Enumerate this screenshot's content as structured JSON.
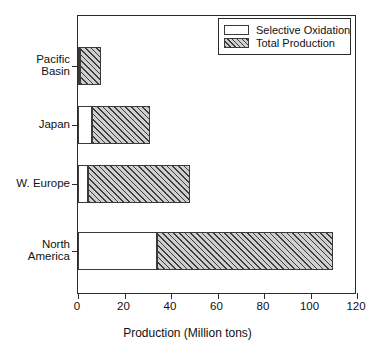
{
  "chart_data": {
    "type": "bar",
    "orientation": "horizontal",
    "stacked": true,
    "title": "",
    "xlabel": "Production (Million tons)",
    "ylabel": "",
    "xlim": [
      0,
      120
    ],
    "xticks": [
      0,
      20,
      40,
      60,
      80,
      100,
      120
    ],
    "xtick_labels": [
      "0",
      "20",
      "40",
      "60",
      "80",
      "100",
      "120"
    ],
    "grid": false,
    "legend_position": "top-right",
    "categories": [
      "Pacific Basin",
      "Japan",
      "W. Europe",
      "North America"
    ],
    "category_labels_wrapped": [
      "Pacific\nBasin",
      "Japan",
      "W. Europe",
      "North\nAmerica"
    ],
    "series": [
      {
        "name": "Selective Oxidation",
        "fill": "white",
        "values": [
          1,
          6,
          4.3,
          34
        ]
      },
      {
        "name": "Total Production",
        "fill": "hatched",
        "values": [
          10,
          31,
          48,
          109.5
        ]
      }
    ]
  },
  "legend": {
    "items": [
      {
        "label": "Selective Oxidation",
        "swatch": "white-box-icon"
      },
      {
        "label": "Total Production",
        "swatch": "hatched-box-icon"
      }
    ]
  },
  "axis": {
    "x_title": "Production (Million tons)",
    "x_tick_labels": [
      "0",
      "20",
      "40",
      "60",
      "80",
      "100",
      "120"
    ],
    "y_tick_labels": [
      "Pacific\nBasin",
      "Japan",
      "W. Europe",
      "North\nAmerica"
    ]
  },
  "colors": {
    "frame": "#2b2b2b",
    "bar_outline": "#3a3a3a",
    "hatch": "#3d3d3d",
    "hatch_bg": "#cfcfcf",
    "background": "#ffffff",
    "text": "#111111"
  }
}
